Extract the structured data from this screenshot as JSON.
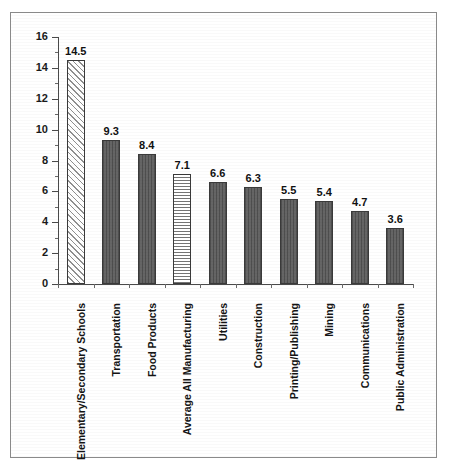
{
  "chart_data": {
    "type": "bar",
    "title": "",
    "subtitle": "",
    "xlabel": "",
    "ylabel": "",
    "ylim": [
      0,
      16
    ],
    "ytick_step": 2,
    "grid": false,
    "legend": "none",
    "orientation": "vertical",
    "value_labels_shown": true,
    "category_label_rotation": -90,
    "categories": [
      "Elementary/Secondary Schools",
      "Transportation",
      "Food Products",
      "Average All Manufacturing",
      "Utilities",
      "Construction",
      "Printing/Publishing",
      "Mining",
      "Communications",
      "Public Administration"
    ],
    "values": [
      14.5,
      9.3,
      8.4,
      7.1,
      6.6,
      6.3,
      5.5,
      5.4,
      4.7,
      3.6
    ],
    "value_label_text": [
      "14.5",
      "9.3",
      "8.4",
      "7.1",
      "6.6",
      "6.3",
      "5.5",
      "5.4",
      "4.7",
      "3.6"
    ],
    "bar_fills": [
      "hatch-light",
      "solid-dark",
      "solid-dark",
      "checker",
      "solid-dark",
      "solid-dark",
      "solid-dark",
      "solid-dark",
      "solid-dark",
      "solid-dark"
    ],
    "ytick_labels": [
      "0",
      "2",
      "4",
      "6",
      "8",
      "10",
      "12",
      "14",
      "16"
    ],
    "ytick_values": [
      0,
      2,
      4,
      6,
      8,
      10,
      12,
      14,
      16
    ],
    "colors": {
      "bar_dark": "#5d5d5d",
      "bar_outline": "#3a3a3a",
      "axis": "#4a4a4a",
      "text": "#111111",
      "frame": "#8a8a8a",
      "background": "#ffffff"
    }
  }
}
